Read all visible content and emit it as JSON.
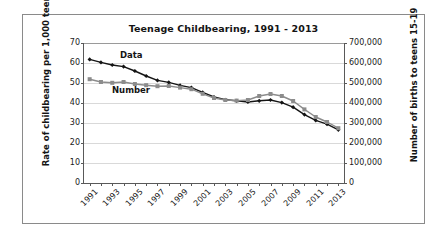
{
  "chart_data": {
    "type": "line",
    "title": "Teenage Childbearing, 1991 - 2013",
    "xlabel": "",
    "ylabel": "Rate of childbearing per 1,000 teens 15-19",
    "y2label": "Number of births to teens 15-19",
    "grid": true,
    "legend_position": "inline-annotations",
    "x": [
      1991,
      1992,
      1993,
      1994,
      1995,
      1996,
      1997,
      1998,
      1999,
      2000,
      2001,
      2002,
      2003,
      2004,
      2005,
      2006,
      2007,
      2008,
      2009,
      2010,
      2011,
      2012,
      2013
    ],
    "xtick_labels": [
      "1991",
      "1993",
      "1995",
      "1997",
      "1999",
      "2001",
      "2003",
      "2005",
      "2007",
      "2009",
      "2011",
      "2013"
    ],
    "xtick_values": [
      1991,
      1993,
      1995,
      1997,
      1999,
      2001,
      2003,
      2005,
      2007,
      2009,
      2011,
      2013
    ],
    "xlim": [
      1990.5,
      2013.5
    ],
    "ylim": [
      0,
      70
    ],
    "ytick_labels": [
      "0",
      "10",
      "20",
      "30",
      "40",
      "50",
      "60",
      "70"
    ],
    "ytick_values": [
      0,
      10,
      20,
      30,
      40,
      50,
      60,
      70
    ],
    "y2lim": [
      0,
      700000
    ],
    "y2tick_labels": [
      "0",
      "100,000",
      "200,000",
      "300,000",
      "400,000",
      "500,000",
      "600,000",
      "700,000"
    ],
    "y2tick_values": [
      0,
      100000,
      200000,
      300000,
      400000,
      500000,
      600000,
      700000
    ],
    "series": [
      {
        "name": "Data",
        "axis": "left",
        "color": "#141414",
        "marker": "diamond",
        "label_text": "Data",
        "values": [
          61.8,
          60.3,
          59.0,
          58.2,
          56.0,
          53.5,
          51.3,
          50.3,
          48.8,
          47.7,
          45.3,
          43.0,
          41.6,
          41.1,
          40.5,
          41.1,
          41.5,
          40.2,
          37.9,
          34.2,
          31.3,
          29.4,
          26.6
        ]
      },
      {
        "name": "Number",
        "axis": "right",
        "color": "#8c8c8c",
        "marker": "square",
        "label_text": "Number",
        "values": [
          519000,
          505000,
          501000,
          505000,
          495000,
          489000,
          484000,
          485000,
          477000,
          469000,
          446000,
          425000,
          415000,
          412000,
          415000,
          435000,
          445000,
          435000,
          410000,
          368000,
          330000,
          305000,
          274000
        ]
      }
    ]
  }
}
